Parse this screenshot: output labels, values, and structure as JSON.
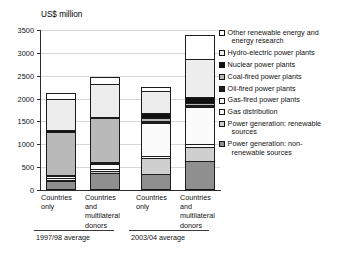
{
  "chart_data": {
    "type": "bar",
    "title": "",
    "ylabel": "US$ million",
    "xlabel": "",
    "ylim": [
      0,
      3500
    ],
    "ytick_labels": [
      "0",
      "500",
      "1000",
      "1500",
      "2000",
      "2500",
      "3000",
      "3500"
    ],
    "ytick_values": [
      0,
      500,
      1000,
      1500,
      2000,
      2500,
      3000,
      3500
    ],
    "grid": true,
    "stacked": true,
    "legend_position": "right",
    "categories": [
      "Countries only",
      "Countries and multilateral donors",
      "Countries only",
      "Countries and multilateral donors"
    ],
    "groups": [
      {
        "label": "1997/98 average",
        "categories": [
          0,
          1
        ]
      },
      {
        "label": "2003/04 average",
        "categories": [
          2,
          3
        ]
      }
    ],
    "series": [
      {
        "name": "Power generation: non-renewable sources",
        "color": "#8f8f8f",
        "values": [
          150,
          330,
          320,
          600
        ]
      },
      {
        "name": "Power generation: renewable sources",
        "color": "#cfcfcf",
        "values": [
          40,
          50,
          340,
          320
        ]
      },
      {
        "name": "Gas distribution",
        "color": "#fdfdfd",
        "values": [
          30,
          40,
          60,
          60
        ]
      },
      {
        "name": "Gas-fired power plants",
        "color": "#fbfbfb",
        "values": [
          40,
          120,
          740,
          810
        ]
      },
      {
        "name": "Oil-fired power plants",
        "color": "#1d1d1d",
        "values": [
          30,
          40,
          40,
          40
        ]
      },
      {
        "name": "Coal-fired power plants",
        "color": "#b9b9b9",
        "values": [
          960,
          970,
          60,
          60
        ]
      },
      {
        "name": "Nuclear power plants",
        "color": "#111111",
        "values": [
          40,
          40,
          120,
          130
        ]
      },
      {
        "name": "Hydro-electric power plants",
        "color": "#ededed",
        "values": [
          700,
          730,
          480,
          840
        ]
      },
      {
        "name": "Other renewable energy and energy research",
        "color": "#ffffff",
        "values": [
          140,
          160,
          90,
          530
        ]
      }
    ],
    "totals": [
      2130,
      2480,
      2250,
      3390
    ]
  },
  "axis": {
    "y_title": "US$ million",
    "ticks": [
      {
        "label": "3500"
      },
      {
        "label": "3000"
      },
      {
        "label": "2500"
      },
      {
        "label": "2000"
      },
      {
        "label": "1500"
      },
      {
        "label": "1000"
      },
      {
        "label": "500"
      },
      {
        "label": "0"
      }
    ]
  },
  "x_labels": [
    {
      "line1": "Countries",
      "line2": "only",
      "line3": "",
      "line4": ""
    },
    {
      "line1": "Countries",
      "line2": "and",
      "line3": "multilateral",
      "line4": "donors"
    },
    {
      "line1": "Countries",
      "line2": "only",
      "line3": "",
      "line4": ""
    },
    {
      "line1": "Countries",
      "line2": "and",
      "line3": "multilateral",
      "line4": "donors"
    }
  ],
  "group_labels": [
    {
      "label": "1997/98 average"
    },
    {
      "label": "2003/04 average"
    }
  ],
  "legend": {
    "items": [
      {
        "label": "Other renewable energy and",
        "label2": "energy research",
        "swatch": "other",
        "color": "#ffffff"
      },
      {
        "label": "Hydro-electric power plants",
        "label2": "",
        "swatch": "hydro",
        "color": "#ededed"
      },
      {
        "label": "Nuclear power plants",
        "label2": "",
        "swatch": "nuclear",
        "color": "#111111"
      },
      {
        "label": "Coal-fired power plants",
        "label2": "",
        "swatch": "coal",
        "color": "#b9b9b9"
      },
      {
        "label": "Oil-fired power plants",
        "label2": "",
        "swatch": "oil",
        "color": "#1d1d1d"
      },
      {
        "label": "Gas-fired power plants",
        "label2": "",
        "swatch": "gasfired",
        "color": "#fbfbfb"
      },
      {
        "label": "Gas distribution",
        "label2": "",
        "swatch": "gasdist",
        "color": "#fdfdfd"
      },
      {
        "label": "Power generation: renewable",
        "label2": "sources",
        "swatch": "pgren",
        "color": "#cfcfcf"
      },
      {
        "label": "Power generation: non-",
        "label2": "renewable sources",
        "swatch": "pgnon",
        "color": "#8f8f8f"
      }
    ]
  }
}
